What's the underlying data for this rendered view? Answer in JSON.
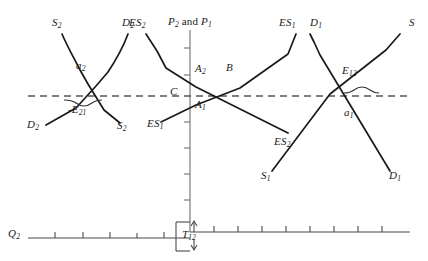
{
  "figure": {
    "type": "economics-diagram",
    "background_color": "#ffffff",
    "line_color": "#1a1a1a",
    "axis_color": "#6f6f6f",
    "dashed_color": "#4a4a4a"
  },
  "axes": {
    "vertical_label": "P2 and P1",
    "vertical_label_parts": {
      "p2": "P",
      "p2_sub": "2",
      "and": "and",
      "p1": "P",
      "p1_sub": "1"
    },
    "horizontal_left_label": "Q2",
    "horizontal_left_label_parts": {
      "base": "Q",
      "sub": "2"
    },
    "vertical_axis_x": 190,
    "vertical_axis_top": 30,
    "vertical_axis_bottom": 232,
    "left_axis_y": 238,
    "left_axis_x_start": 28,
    "left_axis_x_end": 190,
    "right_axis_y": 232,
    "right_axis_x_start": 190,
    "right_axis_x_end": 410,
    "vertical_ticks_y": [
      48,
      75,
      96,
      122,
      148,
      174,
      200,
      222
    ],
    "left_axis_ticks_x": [
      55,
      83,
      110,
      137,
      164
    ],
    "right_axis_ticks_x": [
      214,
      238,
      262,
      286,
      310,
      334,
      358,
      382
    ],
    "price_line_y": 96,
    "price_line_x_start": 28,
    "price_line_x_end": 408
  },
  "labels": {
    "price_line_marker": {
      "text": "C",
      "x": 170,
      "y": 90
    },
    "left_panel": [
      {
        "name": "supply-2-top",
        "base": "S",
        "sub": "2",
        "x": 52,
        "y": 24
      },
      {
        "name": "demand-2-top",
        "base": "D",
        "sub": "2",
        "x": 122,
        "y": 24
      },
      {
        "name": "autarky-point-a2",
        "base": "a",
        "sub": "2",
        "x": 78,
        "y": 67
      },
      {
        "name": "excess-supply-bracket-e21",
        "base": "-E",
        "sub": "21",
        "x": 70,
        "y": 111
      },
      {
        "name": "demand-2-bottom",
        "base": "D",
        "sub": "2",
        "x": 28,
        "y": 126
      },
      {
        "name": "supply-2-bottom",
        "base": "S",
        "sub": "2",
        "x": 118,
        "y": 126
      }
    ],
    "middle_panel": [
      {
        "name": "excess-supply-2-top",
        "base": "ES",
        "sub": "2",
        "x": 131,
        "y": 24
      },
      {
        "name": "excess-supply-1-bottom",
        "base": "ES",
        "sub": "1",
        "x": 148,
        "y": 124
      },
      {
        "name": "point-a2-axis",
        "base": "A",
        "sub": "2",
        "x": 196,
        "y": 70
      },
      {
        "name": "point-a1-axis",
        "base": "A",
        "sub": "1",
        "x": 196,
        "y": 106
      },
      {
        "name": "equilibrium-point-b",
        "base": "B",
        "sub": "",
        "x": 229,
        "y": 69
      },
      {
        "name": "excess-supply-1-top",
        "base": "ES",
        "sub": "1",
        "x": 280,
        "y": 24
      },
      {
        "name": "excess-supply-2-bottom",
        "base": "ES",
        "sub": "2",
        "x": 276,
        "y": 126
      }
    ],
    "right_panel": [
      {
        "name": "demand-1-top",
        "base": "D",
        "sub": "1",
        "x": 312,
        "y": 24
      },
      {
        "name": "supply-top",
        "base": "S",
        "sub": "",
        "x": 408,
        "y": 24
      },
      {
        "name": "excess-demand-bracket-e12",
        "base": "E",
        "sub": "12",
        "x": 342,
        "y": 72
      },
      {
        "name": "autarky-point-a1",
        "base": "a",
        "sub": "1",
        "x": 345,
        "y": 113
      },
      {
        "name": "supply-1-bottom",
        "base": "S",
        "sub": "1",
        "x": 262,
        "y": 176
      },
      {
        "name": "demand-1-bottom",
        "base": "D",
        "sub": "1",
        "x": 392,
        "y": 176
      }
    ],
    "trade_quantity": {
      "name": "trade-volume-t12",
      "base": "T",
      "sub": "12",
      "x": 192,
      "y": 233
    }
  },
  "curves": {
    "left_panel": {
      "supply_2": "M 62,34 C 70,50 78,62 86,78 L 104,110 L 120,122",
      "demand_2": "M 128,34 C 120,52 114,64 104,78 L 78,108 L 45,124",
      "crossing_point": [
        84,
        88
      ]
    },
    "middle_panel": {
      "excess_supply_2": "M 146,34 L 160,52 L 172,72 L 196,88 L 286,132",
      "excess_supply_1": "M 160,122 L 190,104 L 224,92 L 288,54 L 296,34",
      "intersection_b": [
        222,
        96
      ]
    },
    "right_panel": {
      "demand_1": "M 310,34 L 316,44 L 322,56 L 388,170",
      "supply_1": "M 272,170 L 330,94 L 388,48 L 400,34",
      "intersection_a1": [
        358,
        105
      ]
    }
  },
  "braces": {
    "left": {
      "name": "brace-e21",
      "x_start": 63,
      "x_end": 100,
      "y": 101,
      "direction": "down"
    },
    "right": {
      "name": "brace-e12",
      "x_start": 342,
      "x_end": 376,
      "y": 92,
      "direction": "up"
    }
  },
  "trade_marker": {
    "name": "t12-bracket",
    "box_x": 188,
    "box_y": 224,
    "box_width": 14,
    "box_height": 26,
    "arrow_up_y": 222,
    "arrow_down_y": 250
  }
}
